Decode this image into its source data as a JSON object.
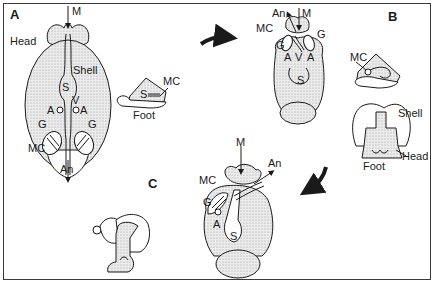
{
  "figure": {
    "panels": [
      {
        "id": "A",
        "label": "A",
        "top_view_labels": {
          "mouth": "M",
          "head": "Head",
          "shell": "Shell",
          "stomach": "S",
          "ventricle": "V",
          "atrium_left": "A",
          "atrium_right": "A",
          "gill_left": "G",
          "gill_right": "G",
          "mantle_cavity": "MC",
          "anus": "An"
        },
        "side_view_labels": {
          "mantle_cavity": "MC",
          "stomach": "S",
          "foot": "Foot"
        }
      },
      {
        "id": "B",
        "label": "B",
        "top_view_labels": {
          "anus": "An",
          "mouth": "M",
          "mantle_cavity": "MC",
          "gill_left": "G",
          "gill_right": "G",
          "atrium_left": "A",
          "ventricle": "V",
          "atrium_right": "A",
          "stomach": "S"
        },
        "side_view_labels": {
          "mantle_cavity": "MC"
        },
        "front_view_labels": {
          "shell": "Shell",
          "head": "Head",
          "foot": "Foot"
        }
      },
      {
        "id": "C",
        "label": "C",
        "top_view_labels": {
          "mouth": "M",
          "anus": "An",
          "mantle_cavity": "MC",
          "gill": "G",
          "atrium": "A",
          "stomach": "S"
        }
      }
    ],
    "arrows": [
      {
        "name": "arrow-a-to-b",
        "from": "A",
        "to": "B"
      },
      {
        "name": "arrow-b-to-c",
        "from": "B",
        "to": "C"
      }
    ],
    "colors": {
      "line": "#1a1a1a",
      "stipple": "#c8c8c8",
      "background": "#ffffff",
      "frame": "#3a3a3a"
    }
  }
}
